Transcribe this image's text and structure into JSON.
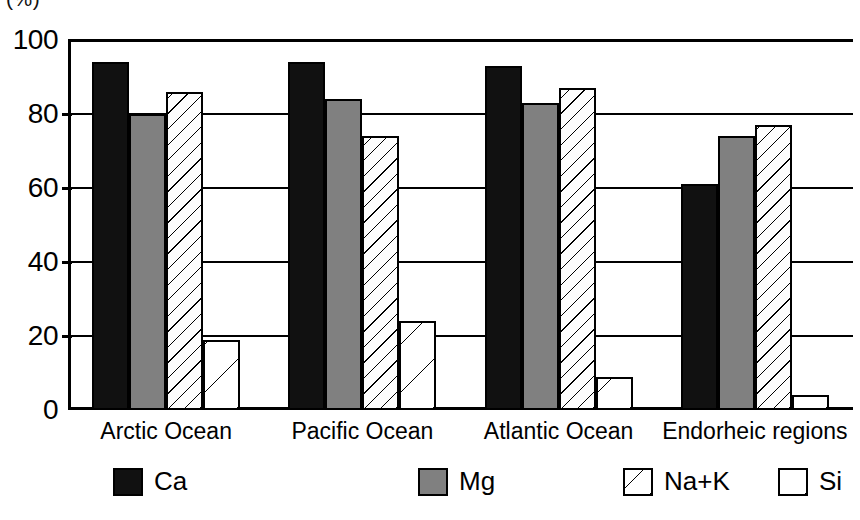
{
  "chart_data": {
    "type": "bar",
    "title": "(%)",
    "xlabel": "",
    "ylabel": "",
    "ylim": [
      0,
      100
    ],
    "yticks": [
      0,
      20,
      40,
      60,
      80,
      100
    ],
    "ytick_labels": [
      "0",
      "20",
      "40",
      "60",
      "80",
      "100"
    ],
    "grid": true,
    "legend_position": "bottom",
    "categories": [
      "Arctic Ocean",
      "Pacific Ocean",
      "Atlantic Ocean",
      "Endorheic regions"
    ],
    "series": [
      {
        "name": "Ca",
        "color": "#111111",
        "pattern": "solid-black",
        "values": [
          94,
          94,
          93,
          61
        ]
      },
      {
        "name": "Mg",
        "color": "#808080",
        "pattern": "solid-gray",
        "values": [
          80,
          84,
          83,
          74
        ]
      },
      {
        "name": "Na+K",
        "color": "#ffffff",
        "pattern": "dense-diagonal-hatch",
        "values": [
          86,
          74,
          87,
          77
        ]
      },
      {
        "name": "Si",
        "color": "#ffffff",
        "pattern": "sparse-diagonal-hatch",
        "values": [
          19,
          24,
          9,
          4
        ]
      }
    ]
  },
  "axis": {
    "unit_label": "(%)"
  },
  "legend": {
    "items": [
      {
        "label": "Ca"
      },
      {
        "label": "Mg"
      },
      {
        "label": "Na+K"
      },
      {
        "label": "Si"
      }
    ]
  }
}
